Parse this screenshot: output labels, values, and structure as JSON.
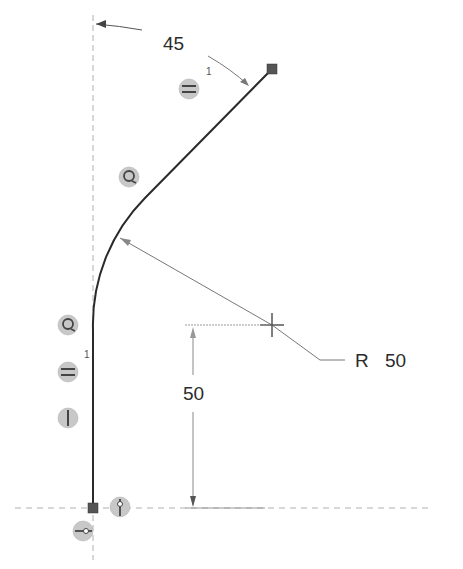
{
  "sketch": {
    "geometry": {
      "vertical_line": {
        "x": 93,
        "y_start": 508,
        "y_end": 330
      },
      "arc": {
        "radius_px": 180,
        "center": [
          272,
          325
        ]
      },
      "angled_line": {
        "start": [
          135,
          207
        ],
        "end": [
          272,
          69
        ]
      },
      "start_point": [
        93,
        508
      ],
      "end_point": [
        272,
        69
      ]
    },
    "construction_lines": {
      "vertical_centerline_x": 93,
      "horizontal_baseline_y": 508
    },
    "dimensions": {
      "angle": {
        "label": "45",
        "units": "deg"
      },
      "radius": {
        "prefix": "R",
        "label": "50"
      },
      "vertical": {
        "label": "50"
      }
    },
    "constraints": [
      {
        "type": "equal",
        "glyph": "=",
        "index_label": "1",
        "position": [
          189,
          89
        ]
      },
      {
        "type": "tangent",
        "glyph": "⟳",
        "position": [
          129,
          177
        ]
      },
      {
        "type": "tangent",
        "glyph": "⟳",
        "position": [
          68,
          325
        ]
      },
      {
        "type": "equal",
        "glyph": "=",
        "index_label": "1",
        "position": [
          68,
          372
        ]
      },
      {
        "type": "vertical",
        "glyph": "|",
        "position": [
          68,
          418
        ]
      },
      {
        "type": "coincident-vertical",
        "glyph": "⧫",
        "position": [
          120,
          508
        ]
      },
      {
        "type": "coincident-horizontal",
        "glyph": "⊸",
        "position": [
          83,
          531
        ]
      }
    ],
    "colors": {
      "geometry": "#2a2a2a",
      "construction": "#aaaaaa",
      "dimension": "#7a7a7a",
      "endpoint": "#555555",
      "constraint_fill": "#c8c8c8"
    }
  }
}
